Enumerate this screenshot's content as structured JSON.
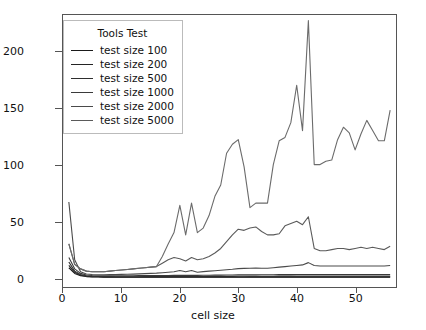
{
  "chart_data": {
    "type": "line",
    "title": "",
    "xlabel": "cell size",
    "ylabel": "execution time [s]",
    "xlim": [
      0,
      57
    ],
    "ylim": [
      -8,
      232
    ],
    "xticks": [
      0,
      10,
      20,
      30,
      40,
      50
    ],
    "yticks": [
      0,
      50,
      100,
      150,
      200
    ],
    "grid": false,
    "legend_title": "Tools Test",
    "legend_position": "upper left",
    "x": [
      1,
      2,
      3,
      4,
      5,
      6,
      7,
      8,
      9,
      10,
      11,
      12,
      13,
      14,
      15,
      16,
      17,
      18,
      19,
      20,
      21,
      22,
      23,
      24,
      25,
      26,
      27,
      28,
      29,
      30,
      31,
      32,
      33,
      34,
      35,
      36,
      37,
      38,
      39,
      40,
      41,
      42,
      43,
      44,
      45,
      46,
      47,
      48,
      49,
      50,
      51,
      52,
      53,
      54,
      55,
      56
    ],
    "series": [
      {
        "name": "test size 100",
        "color": "#1a1a1a",
        "values": [
          9,
          4,
          2,
          1.2,
          0.9,
          0.8,
          0.7,
          0.7,
          0.6,
          0.6,
          0.6,
          0.6,
          0.6,
          0.6,
          0.6,
          0.6,
          0.6,
          0.6,
          0.6,
          0.6,
          0.6,
          0.6,
          0.6,
          0.6,
          0.6,
          0.6,
          0.6,
          0.6,
          0.6,
          0.6,
          0.6,
          0.6,
          0.6,
          0.6,
          0.6,
          0.6,
          0.6,
          0.6,
          0.6,
          0.6,
          0.6,
          0.6,
          0.6,
          0.6,
          0.6,
          0.6,
          0.6,
          0.6,
          0.6,
          0.6,
          0.6,
          0.6,
          0.6,
          0.6,
          0.6,
          0.6
        ]
      },
      {
        "name": "test size 200",
        "color": "#242424",
        "values": [
          11,
          5,
          2.4,
          1.5,
          1.1,
          1,
          0.9,
          0.9,
          0.8,
          0.8,
          0.8,
          0.8,
          0.8,
          0.8,
          0.8,
          0.8,
          0.8,
          0.8,
          0.8,
          0.8,
          0.8,
          0.8,
          0.8,
          0.8,
          0.8,
          0.8,
          0.8,
          0.8,
          0.8,
          0.8,
          0.8,
          0.9,
          0.9,
          0.9,
          0.9,
          0.9,
          0.9,
          0.9,
          0.9,
          0.9,
          0.9,
          0.9,
          0.9,
          0.9,
          0.9,
          0.9,
          0.9,
          0.9,
          0.9,
          0.9,
          0.9,
          0.9,
          0.9,
          0.9,
          0.9,
          0.9
        ]
      },
      {
        "name": "test size 500",
        "color": "#2e2e2e",
        "values": [
          14,
          6,
          3,
          1.9,
          1.5,
          1.3,
          1.2,
          1.2,
          1.1,
          1.1,
          1.1,
          1.1,
          1.1,
          1.2,
          1.2,
          1.2,
          1.2,
          1.2,
          1.3,
          1.3,
          1.3,
          1.3,
          1.3,
          1.3,
          1.4,
          1.4,
          1.4,
          1.4,
          1.4,
          1.5,
          1.5,
          1.5,
          1.5,
          1.5,
          1.5,
          1.5,
          1.6,
          1.6,
          1.6,
          1.6,
          1.6,
          1.6,
          1.6,
          1.6,
          1.6,
          1.6,
          1.6,
          1.6,
          1.6,
          1.6,
          1.6,
          1.6,
          1.6,
          1.6,
          1.6,
          1.6
        ]
      },
      {
        "name": "test size 1000",
        "color": "#3a3a3a",
        "values": [
          18,
          8,
          4,
          2.6,
          2.1,
          1.9,
          1.8,
          1.8,
          1.8,
          1.8,
          1.9,
          1.9,
          2,
          2,
          2.1,
          2.1,
          2.2,
          2.2,
          2.3,
          2.3,
          2.3,
          2.3,
          2.3,
          2.4,
          2.4,
          2.5,
          2.5,
          2.6,
          2.6,
          2.7,
          2.7,
          2.7,
          2.7,
          2.8,
          2.8,
          2.8,
          2.9,
          2.9,
          2.9,
          3,
          3,
          3,
          3,
          3,
          3,
          3,
          3,
          3,
          3,
          3,
          3,
          3,
          3,
          3,
          3,
          3
        ]
      },
      {
        "name": "test size 2000",
        "color": "#4a4a4a",
        "values": [
          67,
          16,
          5.5,
          3.5,
          3,
          2.8,
          2.8,
          2.9,
          3,
          3.1,
          3.3,
          3.4,
          3.6,
          3.8,
          4,
          4.2,
          4.6,
          5,
          5.4,
          6.5,
          5.4,
          6.5,
          5,
          5.6,
          6,
          6.4,
          6.8,
          7.2,
          7.6,
          8.2,
          8.4,
          8.6,
          8.7,
          8.6,
          8.5,
          9,
          9.5,
          10,
          10.5,
          11,
          11.5,
          13.5,
          11,
          10.5,
          10.5,
          10.5,
          10.5,
          10.5,
          10.5,
          10.5,
          10.5,
          10.5,
          10.5,
          10.5,
          10.5,
          11
        ]
      },
      {
        "name": "test size 5000",
        "color": "#5a5a5a",
        "values": [
          30,
          12,
          8,
          6,
          5.5,
          5.5,
          5.5,
          6,
          6.5,
          7,
          7.5,
          8,
          8.5,
          9,
          9.5,
          10,
          13,
          16,
          18,
          17,
          15,
          18,
          16,
          17,
          19,
          22,
          26,
          32,
          38,
          43,
          42,
          44,
          45,
          41,
          38,
          38,
          39,
          46,
          48,
          50,
          47,
          54,
          26,
          24,
          24,
          25,
          26,
          26,
          25,
          26,
          27,
          26,
          27,
          26,
          25,
          28
        ]
      },
      {
        "name": "test size 5000 upper",
        "color": "#6b6b6b",
        "values": [
          30,
          12,
          8,
          6,
          5.5,
          5.5,
          5.5,
          6,
          6.5,
          7,
          7.5,
          8,
          8.5,
          9,
          9.5,
          10,
          19,
          30,
          40,
          64,
          38,
          66,
          40,
          44,
          55,
          72,
          82,
          110,
          118,
          122,
          98,
          62,
          66,
          66,
          66,
          100,
          121,
          124,
          137,
          170,
          130,
          227,
          100,
          100,
          103,
          104,
          122,
          133,
          128,
          113,
          127,
          139,
          130,
          121,
          121,
          148
        ]
      }
    ]
  },
  "legend": {
    "title": "Tools Test",
    "items": [
      {
        "label": "test size 100",
        "color": "#1a1a1a"
      },
      {
        "label": "test size 200",
        "color": "#242424"
      },
      {
        "label": "test size 500",
        "color": "#2e2e2e"
      },
      {
        "label": "test size 1000",
        "color": "#3a3a3a"
      },
      {
        "label": "test size 2000",
        "color": "#4a4a4a"
      },
      {
        "label": "test size 5000",
        "color": "#5a5a5a"
      }
    ]
  },
  "axes": {
    "ylabel": "execution time [s]",
    "xlabel": "cell size",
    "yticklabels": [
      "0",
      "50",
      "100",
      "150",
      "200"
    ],
    "xticklabels": [
      "0",
      "10",
      "20",
      "30",
      "40",
      "50"
    ]
  }
}
